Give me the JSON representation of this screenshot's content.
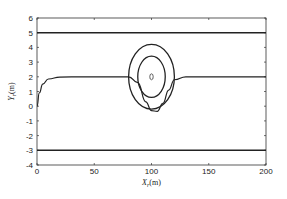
{
  "chart_data": {
    "type": "line",
    "title": "",
    "xlabel": "X_r (m)",
    "ylabel": "Y_r (m)",
    "xlim": [
      0,
      200
    ],
    "ylim": [
      -4,
      6
    ],
    "xticks": [
      0,
      50,
      100,
      150,
      200
    ],
    "yticks": [
      -4,
      -3,
      -2,
      -1,
      0,
      1,
      2,
      3,
      4,
      5,
      6
    ],
    "grid": false,
    "legend": null,
    "series": [
      {
        "name": "upper boundary",
        "x": [
          0,
          200
        ],
        "y": [
          5,
          5
        ]
      },
      {
        "name": "lower boundary",
        "x": [
          0,
          200
        ],
        "y": [
          -3,
          -3
        ]
      },
      {
        "name": "trajectory",
        "x": [
          0,
          2,
          5,
          10,
          20,
          40,
          80,
          88,
          95,
          100,
          105,
          110,
          115,
          120,
          130,
          200
        ],
        "y": [
          0,
          0.9,
          1.5,
          1.85,
          1.98,
          2.0,
          2.0,
          1.6,
          0.3,
          -0.3,
          -0.35,
          0.2,
          1.1,
          1.8,
          2.0,
          2.0
        ]
      },
      {
        "name": "outer ellipse",
        "center": [
          100,
          2
        ],
        "rx": 20,
        "ry": 2.2
      },
      {
        "name": "inner ellipse",
        "center": [
          100,
          2
        ],
        "rx": 12,
        "ry": 1.4
      },
      {
        "name": "obstacle",
        "center": [
          100,
          2
        ],
        "rx": 1.5,
        "ry": 0.1
      }
    ]
  },
  "labels": {
    "xlabel_main": "X",
    "xlabel_sub": "r",
    "xlabel_unit": "(m)",
    "ylabel_main": "Y",
    "ylabel_sub": "r",
    "ylabel_unit": "(m)"
  }
}
